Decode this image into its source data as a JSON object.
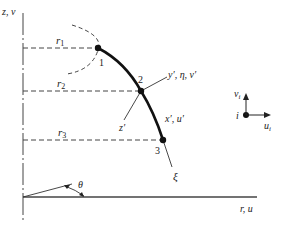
{
  "axes": {
    "vertical_label": "z, v",
    "horizontal_label": "r, u"
  },
  "radii": [
    {
      "label": "r",
      "sub": "1"
    },
    {
      "label": "r",
      "sub": "2"
    },
    {
      "label": "r",
      "sub": "3"
    }
  ],
  "nodes": [
    {
      "label": "1"
    },
    {
      "label": "2"
    },
    {
      "label": "3"
    }
  ],
  "local_axes": {
    "y_axis": "y′, η, v′",
    "x_axis": "x′, u′",
    "z_axis": "z′",
    "xi": "ξ"
  },
  "angle": {
    "label": "θ"
  },
  "node_i": {
    "label": "i",
    "v_label": "v",
    "v_sub": "i",
    "u_label": "u",
    "u_sub": "i"
  },
  "colors": {
    "ink": "#222222",
    "dash": "#444444"
  }
}
